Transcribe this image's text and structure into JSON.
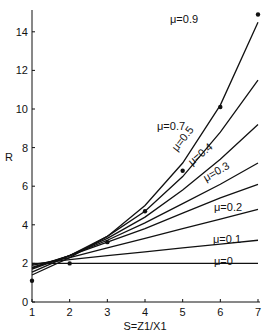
{
  "chart_data": {
    "type": "line",
    "title": "",
    "xlabel": "S=Z1/X1",
    "ylabel": "R",
    "xlim": [
      1,
      7
    ],
    "ylim": [
      0,
      15
    ],
    "x_ticks": [
      1,
      2,
      3,
      4,
      5,
      6,
      7
    ],
    "y_ticks": [
      0,
      2,
      4,
      6,
      8,
      10,
      12,
      14
    ],
    "grid": false,
    "legend": "inline curve labels",
    "x": [
      1,
      2,
      3,
      4,
      5,
      6,
      7
    ],
    "series": [
      {
        "name": "μ=0",
        "values": [
          2.0,
          2.0,
          2.0,
          2.0,
          2.0,
          2.0,
          2.0
        ]
      },
      {
        "name": "μ=0.1",
        "values": [
          1.95,
          2.2,
          2.4,
          2.6,
          2.8,
          3.0,
          3.2
        ]
      },
      {
        "name": "μ=0.2",
        "values": [
          1.9,
          2.3,
          2.8,
          3.3,
          3.8,
          4.3,
          4.8
        ]
      },
      {
        "name": "μ=0.3",
        "values": [
          1.8,
          2.4,
          3.1,
          3.8,
          4.6,
          5.4,
          6.1
        ]
      },
      {
        "name": "μ=0.4",
        "values": [
          1.75,
          2.4,
          3.2,
          4.1,
          5.1,
          6.1,
          7.2
        ]
      },
      {
        "name": "μ=0.5",
        "values": [
          1.7,
          2.4,
          3.3,
          4.4,
          5.8,
          7.4,
          9.2
        ]
      },
      {
        "name": "μ=0.7",
        "values": [
          1.55,
          2.4,
          3.4,
          4.7,
          6.5,
          8.8,
          11.5
        ]
      },
      {
        "name": "μ=0.9",
        "values": [
          1.4,
          2.3,
          3.4,
          5.0,
          7.2,
          10.2,
          14.5
        ]
      }
    ],
    "points": {
      "name": "measured",
      "x": [
        1,
        2,
        3,
        4,
        5,
        6,
        7
      ],
      "y": [
        1.1,
        2.0,
        3.1,
        4.7,
        6.8,
        10.1,
        14.9
      ]
    },
    "annotations": [
      "μ=0.9",
      "μ=0.7",
      "μ=0.5",
      "μ=0.4",
      "μ=0.3",
      "μ=0.2",
      "μ=0.1",
      "μ=0"
    ]
  }
}
